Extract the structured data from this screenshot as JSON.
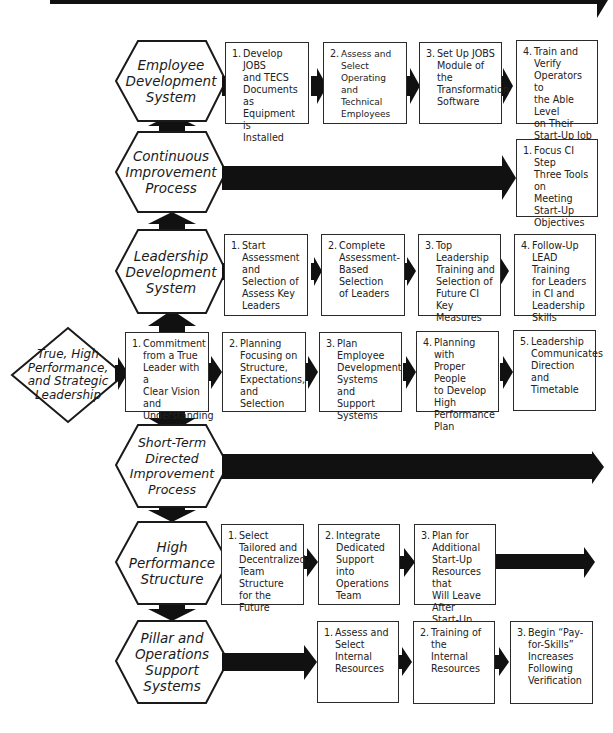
{
  "diagram": {
    "origin": {
      "label": "True, High\nPerformance,\nand Strategic\nLeadership"
    },
    "systems": [
      {
        "id": "employee-development",
        "label": "Employee\nDevelopment\nSystem",
        "steps": [
          {
            "num": "1.",
            "text": "Develop JOBS\nand TECS\nDocuments as\nEquipment is\nInstalled"
          },
          {
            "num": "2.",
            "text": "Assess and Select\nOperating and\nTechnical\nEmployees"
          },
          {
            "num": "3.",
            "text": "Set Up JOBS\nModule of the\nTransformation\nSoftware"
          },
          {
            "num": "4.",
            "text": "Train and Verify\nOperators to\nthe Able Level\non Their\nStart-Up Job"
          }
        ]
      },
      {
        "id": "continuous-improvement",
        "label": "Continuous\nImprovement\nProcess",
        "steps": [
          {
            "num": "1.",
            "text": "Focus CI Step\nThree Tools on\nMeeting\nStart-Up\nObjectives"
          }
        ]
      },
      {
        "id": "leadership-development",
        "label": "Leadership\nDevelopment\nSystem",
        "steps": [
          {
            "num": "1.",
            "text": "Start\nAssessment and\nSelection of\nAssess Key\nLeaders"
          },
          {
            "num": "2.",
            "text": "Complete\nAssessment-\nBased Selection\nof Leaders"
          },
          {
            "num": "3.",
            "text": "Top Leadership\nTraining and\nSelection of\nFuture CI Key\nMeasures"
          },
          {
            "num": "4.",
            "text": "Follow-Up\nLEAD Training\nfor Leaders\nin CI and\nLeadership\nSkills"
          }
        ]
      },
      {
        "id": "leadership-core",
        "steps": [
          {
            "num": "1.",
            "text": "Commitment\nfrom a True\nLeader with a\nClear Vision and\nUnderstanding"
          },
          {
            "num": "2.",
            "text": "Planning\nFocusing on\nStructure,\nExpectations,\nand Selection"
          },
          {
            "num": "3.",
            "text": "Plan Employee\nDevelopment\nSystems and\nSupport\nSystems"
          },
          {
            "num": "4.",
            "text": "Planning with\nProper People\nto Develop High\nPerformance\nPlan"
          },
          {
            "num": "5.",
            "text": "Leadership\nCommunicates\nDirection and\nTimetable"
          }
        ]
      },
      {
        "id": "short-term-directed",
        "label": "Short-Term\nDirected\nImprovement\nProcess",
        "steps": []
      },
      {
        "id": "high-performance",
        "label": "High\nPerformance\nStructure",
        "steps": [
          {
            "num": "1.",
            "text": "Select\nTailored and\nDecentralized\nTeam Structure\nfor the Future"
          },
          {
            "num": "2.",
            "text": "Integrate\nDedicated\nSupport into\nOperations\nTeam"
          },
          {
            "num": "3.",
            "text": "Plan for\nAdditional\nStart-Up\nResources that\nWill Leave After\nStart-Up"
          }
        ]
      },
      {
        "id": "pillar-operations",
        "label": "Pillar and\nOperations\nSupport\nSystems",
        "steps": [
          {
            "num": "1.",
            "text": "Assess and\nSelect Internal\nResources"
          },
          {
            "num": "2.",
            "text": "Training of the\nInternal\nResources"
          },
          {
            "num": "3.",
            "text": "Begin “Pay-\nfor-Skills”\nIncreases\nFollowing\nVerification"
          }
        ]
      }
    ],
    "colors": {
      "stroke": "#1a1a1a",
      "arrow_fill": "#111111",
      "background": "#ffffff"
    }
  }
}
